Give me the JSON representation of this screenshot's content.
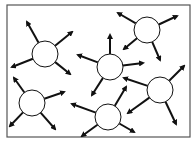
{
  "diagram": {
    "title": "",
    "frame": {
      "x": 7,
      "y": 5,
      "width": 183,
      "height": 132,
      "stroke": "#555555"
    },
    "colors": {
      "stroke": "#111111",
      "fill": "#ffffff"
    },
    "circle_radius": 13,
    "nodes": [
      {
        "id": "A",
        "cx": 45,
        "cy": 54,
        "arrows": [
          [
            27,
            22
          ],
          [
            72,
            32
          ],
          [
            12,
            67
          ],
          [
            70,
            74
          ]
        ]
      },
      {
        "id": "B",
        "cx": 147,
        "cy": 30,
        "arrows": [
          [
            118,
            13
          ],
          [
            177,
            16
          ],
          [
            124,
            49
          ],
          [
            160,
            60
          ]
        ]
      },
      {
        "id": "C",
        "cx": 110,
        "cy": 67,
        "arrows": [
          [
            110,
            35
          ],
          [
            78,
            55
          ],
          [
            143,
            63
          ],
          [
            92,
            95
          ]
        ]
      },
      {
        "id": "D",
        "cx": 160,
        "cy": 90,
        "arrows": [
          [
            184,
            66
          ],
          [
            124,
            78
          ],
          [
            128,
            113
          ],
          [
            176,
            124
          ]
        ]
      },
      {
        "id": "E",
        "cx": 32,
        "cy": 103,
        "arrows": [
          [
            14,
            78
          ],
          [
            64,
            92
          ],
          [
            10,
            126
          ],
          [
            55,
            129
          ]
        ]
      },
      {
        "id": "F",
        "cx": 108,
        "cy": 117,
        "arrows": [
          [
            126,
            87
          ],
          [
            72,
            104
          ],
          [
            82,
            136
          ],
          [
            134,
            132
          ]
        ]
      }
    ]
  }
}
